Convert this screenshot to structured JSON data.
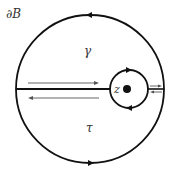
{
  "labels": {
    "boundary": "∂B",
    "gamma": "γ",
    "tau": "τ",
    "point": "z"
  },
  "colors": {
    "stroke": "#111111",
    "thin_arrow": "#555555",
    "text": "#333333",
    "background": "#ffffff"
  },
  "geometry": {
    "outer_circle": {
      "cx": 90,
      "cy": 89,
      "r": 74
    },
    "inner_circle": {
      "cx": 129,
      "cy": 89,
      "r": 19
    },
    "point_dot": {
      "cx": 127,
      "cy": 89,
      "r": 4
    }
  }
}
